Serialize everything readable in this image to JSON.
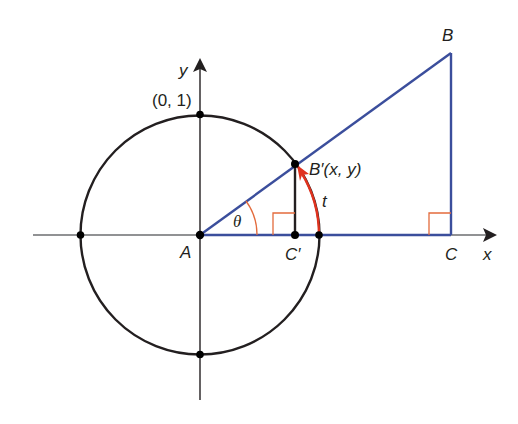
{
  "diagram": {
    "colors": {
      "axis": "#231f20",
      "circle": "#231f20",
      "line_blue": "#3b4e9c",
      "arc_red": "#e0321e",
      "right_angle_marker": "#e36b3c",
      "theta_arc": "#e36b3c",
      "point": "#000000"
    },
    "labels": {
      "y_axis": "y",
      "x_axis": "x",
      "top_point": "(0, 1)",
      "A": "A",
      "B": "B",
      "B_prime": "B′(x, y)",
      "C": "C",
      "C_prime": "C′",
      "t": "t",
      "theta": "θ"
    },
    "geometry": {
      "origin_A": [
        200,
        235
      ],
      "radius": 119,
      "B_prime": [
        295,
        164
      ],
      "C_prime": [
        295,
        235
      ],
      "B": [
        451,
        53
      ],
      "C": [
        451,
        235
      ],
      "circle_points": [
        [
          200,
          114
        ],
        [
          319,
          235
        ],
        [
          200,
          354
        ],
        [
          81,
          235
        ],
        [
          295,
          164
        ],
        [
          295,
          235
        ]
      ],
      "x_axis": {
        "from": [
          33,
          235
        ],
        "to": [
          497,
          235
        ]
      },
      "y_axis": {
        "from": [
          200,
          400
        ],
        "to": [
          200,
          60
        ]
      }
    }
  }
}
